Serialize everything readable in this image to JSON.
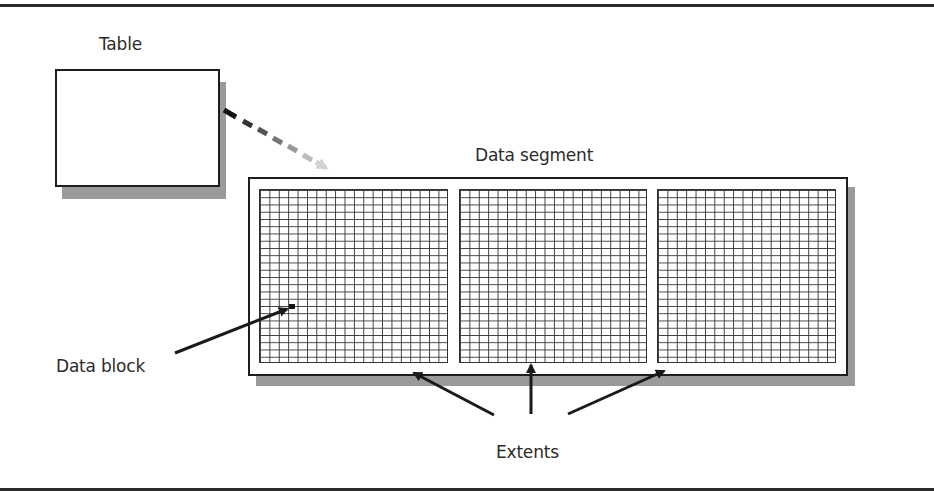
{
  "diagram": {
    "title_rules": {
      "top": true,
      "bottom": true
    },
    "labels": {
      "table": "Table",
      "data_segment": "Data segment",
      "data_block": "Data block",
      "extents": "Extents"
    },
    "nodes": [
      {
        "id": "table",
        "label": "Table",
        "shape": "rectangle-with-shadow"
      },
      {
        "id": "data_segment",
        "label": "Data segment",
        "shape": "rectangle-with-shadow",
        "children": [
          {
            "id": "extent_1",
            "grid_columns": 20,
            "grid_rows": 24
          },
          {
            "id": "extent_2",
            "grid_columns": 20,
            "grid_rows": 24
          },
          {
            "id": "extent_3",
            "grid_columns": 20,
            "grid_rows": 24
          }
        ]
      },
      {
        "id": "data_block",
        "label": "Data block",
        "shape": "small-filled-cell",
        "inside": "extent_1"
      }
    ],
    "edges": [
      {
        "from": "table",
        "to": "data_segment",
        "style": "dashed-gradient-arrow"
      },
      {
        "from": "data_block_label",
        "to": "data_block",
        "style": "solid-arrow"
      },
      {
        "from": "extents_label",
        "to": "extent_1",
        "style": "solid-arrow"
      },
      {
        "from": "extents_label",
        "to": "extent_2",
        "style": "solid-arrow"
      },
      {
        "from": "extents_label",
        "to": "extent_3",
        "style": "solid-arrow"
      }
    ],
    "colors": {
      "stroke": "#1e1e1e",
      "shadow": "#9a9a9a",
      "grid": "#3a3a3a",
      "background": "#ffffff"
    }
  }
}
